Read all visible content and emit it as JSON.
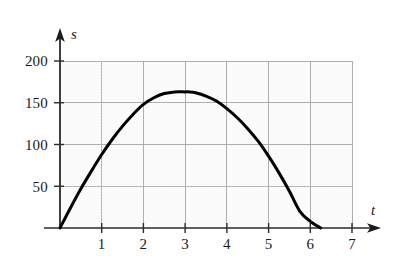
{
  "chart_data": {
    "type": "line",
    "title": "",
    "subtitle": "",
    "xlabel": "t",
    "ylabel": "s",
    "xlim": [
      0,
      7
    ],
    "ylim": [
      0,
      210
    ],
    "grid": true,
    "legend": null,
    "legend_position": "none",
    "x_ticks": [
      1,
      2,
      3,
      4,
      5,
      6,
      7
    ],
    "x_tick_labels": [
      "1",
      "2",
      "3",
      "4",
      "5",
      "6",
      "7"
    ],
    "y_ticks": [
      50,
      100,
      150,
      200
    ],
    "y_tick_labels": [
      "50",
      "100",
      "150",
      "200"
    ],
    "grid_x": [
      0,
      1,
      2,
      3,
      4,
      5,
      6,
      7
    ],
    "grid_y": [
      0,
      50,
      100,
      150,
      200
    ],
    "series": [
      {
        "name": "s(t)",
        "style": "solid",
        "color": "#000000",
        "width": 3,
        "x": [
          0.0,
          0.25,
          0.5,
          0.75,
          1.0,
          1.25,
          1.5,
          1.75,
          2.0,
          2.25,
          2.5,
          2.75,
          3.0,
          3.1,
          3.25,
          3.5,
          3.75,
          4.0,
          4.25,
          4.5,
          4.75,
          5.0,
          5.25,
          5.5,
          5.75,
          6.0,
          6.25
        ],
        "y": [
          0,
          24,
          47,
          68,
          88,
          106,
          122,
          136,
          148,
          156,
          161,
          163,
          163,
          163,
          162,
          158,
          152,
          143,
          132,
          119,
          104,
          86,
          66,
          44,
          20,
          8,
          0
        ]
      }
    ],
    "annotations": [],
    "curve": {
      "description": "downward-opening parabola starting at origin",
      "vertex_t": 3.1,
      "vertex_s": 163,
      "root_left_t": 0,
      "root_right_t": 6.25
    },
    "colors": {
      "curve": "#000000",
      "axis": "#2b2b2b",
      "grid_major": "#a9a9a9",
      "grid_minor": "#d8d8d8",
      "plot_background": "#fbfbfb",
      "text": "#1b1b1b"
    }
  },
  "axes": {
    "y_axis_label": "s",
    "x_axis_label": "t"
  }
}
